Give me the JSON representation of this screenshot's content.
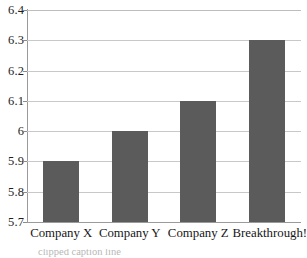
{
  "chart_data": {
    "type": "bar",
    "title": "",
    "subtitle": "",
    "xlabel": "",
    "ylabel": "",
    "categories": [
      "Company X",
      "Company Y",
      "Company Z",
      "Breakthrough!"
    ],
    "values": [
      5.9,
      6.0,
      6.1,
      6.3
    ],
    "ylim": [
      5.7,
      6.4
    ],
    "yticks": [
      6.4,
      6.3,
      6.2,
      6.1,
      6.0,
      5.9,
      5.8,
      5.7
    ],
    "ytick_labels": [
      "6.4",
      "6.3",
      "6.2",
      "6.1",
      "6",
      "5.9",
      "5.8",
      "5.7"
    ],
    "grid": true,
    "legend": false,
    "legend_position": "none",
    "series": [
      {
        "name": "",
        "values": [
          5.9,
          6.0,
          6.1,
          6.3
        ]
      }
    ],
    "bar_color": "#5b5b5b",
    "gridline_color": "#c8c8c8",
    "axis_color": "#9a9a9a",
    "background_color": "#ffffff"
  },
  "caption": {
    "text": "clipped caption line"
  }
}
